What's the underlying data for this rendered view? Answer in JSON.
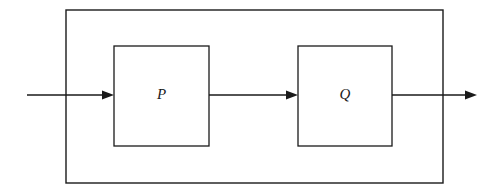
{
  "diagram": {
    "type": "block-diagram",
    "background_color": "#ffffff",
    "line_color": "#1a1a1a",
    "system_boundary": {
      "name": "outer system boundary",
      "x": 66,
      "y": 10,
      "width": 377,
      "height": 173
    },
    "blocks": [
      {
        "label": "P",
        "x": 114,
        "y": 46,
        "width": 95,
        "height": 100
      },
      {
        "label": "Q",
        "x": 298,
        "y": 46,
        "width": 94,
        "height": 100
      }
    ],
    "signals": [
      {
        "name": "input-signal",
        "label": "",
        "from_x": 27,
        "to_x": 114,
        "y": 95,
        "arrowhead": true
      },
      {
        "name": "intermediate-signal",
        "label": "",
        "from_x": 209,
        "to_x": 298,
        "y": 95,
        "arrowhead": true
      },
      {
        "name": "output-signal",
        "label": "",
        "from_x": 392,
        "to_x": 477,
        "y": 95,
        "arrowhead": true
      }
    ]
  }
}
